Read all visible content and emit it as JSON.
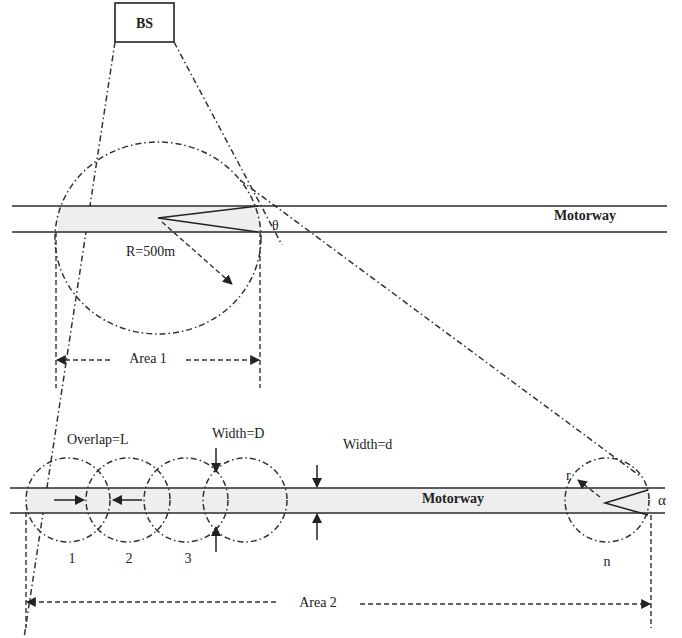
{
  "diagram": {
    "base_station": {
      "label": "BS"
    },
    "area1": {
      "road_label": "Motorway",
      "radius_label": "R=500m",
      "angle_label": "θ",
      "span_label": "Area 1"
    },
    "area2": {
      "road_label": "Motorway",
      "overlap_label": "Overlap=L",
      "cell_width_label": "Width=D",
      "road_width_label": "Width=d",
      "radius_label": "r",
      "angle_label": "α",
      "cell_labels": [
        "1",
        "2",
        "3",
        "n"
      ],
      "span_label": "Area 2"
    },
    "colors": {
      "line": "#2a2a2a",
      "road_fill": "#eeeeee",
      "background": "#ffffff"
    }
  }
}
